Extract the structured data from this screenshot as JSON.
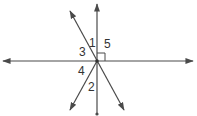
{
  "diagram": {
    "type": "intersecting-lines-angles",
    "colors": {
      "line": "#4a4a4a",
      "label": "#333333",
      "background": "#ffffff"
    },
    "intersection": {
      "x": 97,
      "y": 61
    },
    "lines": [
      {
        "id": "horizontal",
        "x1": 3,
        "y1": 61,
        "x2": 193,
        "y2": 61,
        "start": "arrow",
        "end": "arrow"
      },
      {
        "id": "vertical",
        "x1": 97,
        "y1": 4,
        "x2": 97,
        "y2": 114,
        "start": "arrow",
        "end": "dot"
      },
      {
        "id": "diagonal-nw-se",
        "x1": 70,
        "y1": 11,
        "x2": 124,
        "y2": 110,
        "start": "arrow",
        "end": "arrow"
      },
      {
        "id": "ray-sw",
        "x1": 97,
        "y1": 61,
        "x2": 70,
        "y2": 110,
        "start": "none",
        "end": "arrow"
      }
    ],
    "right_angle_marker": {
      "x": 97,
      "y": 53,
      "size": 8,
      "angle": "5"
    },
    "angle_labels": [
      {
        "id": "angle-1",
        "text": "1",
        "x": 89,
        "y": 47
      },
      {
        "id": "angle-5",
        "text": "5",
        "x": 104,
        "y": 48
      },
      {
        "id": "angle-3",
        "text": "3",
        "x": 79,
        "y": 56
      },
      {
        "id": "angle-4",
        "text": "4",
        "x": 78,
        "y": 75
      },
      {
        "id": "angle-2",
        "text": "2",
        "x": 88,
        "y": 91
      }
    ]
  }
}
